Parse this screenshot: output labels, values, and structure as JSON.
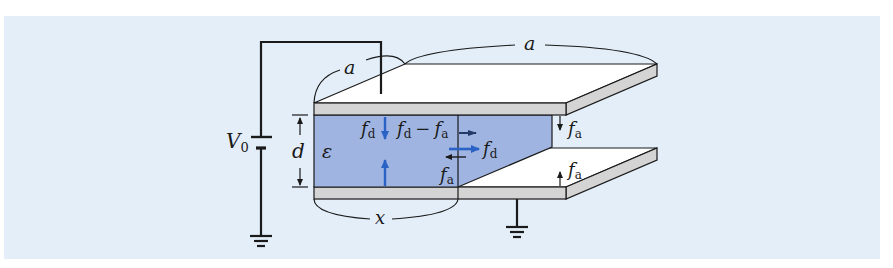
{
  "figure": {
    "type": "diagram",
    "colors": {
      "background_panel": "#e3eef9",
      "dielectric_fill": "#9fb4e0",
      "plate_edge_fill": "#d4d4d4",
      "plate_top_fill": "#ffffff",
      "force_arrow_blue": "#2a62c6",
      "line_color": "#1a1a1a"
    },
    "labels": {
      "side_a_left": "a",
      "side_a_back": "a",
      "voltage": "V",
      "voltage_sub": "0",
      "gap": "d",
      "permittivity": "ε",
      "insertion_length": "x",
      "force_fd_top": "f",
      "force_fd_top_sub": "d",
      "force_diff": "f",
      "force_diff_sub1": "d",
      "force_diff_minus": "−",
      "force_diff_f2": "f",
      "force_diff_sub2": "a",
      "force_fd_right": "f",
      "force_fd_right_sub": "d",
      "force_fa_left": "f",
      "force_fa_left_sub": "a",
      "force_fa_upper_right": "f",
      "force_fa_upper_right_sub": "a",
      "force_fa_lower_right": "f",
      "force_fa_lower_right_sub": "a"
    }
  }
}
